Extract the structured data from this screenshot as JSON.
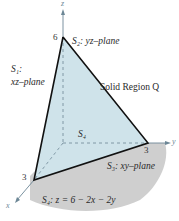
{
  "diagram": {
    "axes": {
      "x_label": "x",
      "y_label": "y",
      "z_label": "z",
      "tick_z": "6",
      "tick_y": "3",
      "tick_x": "3"
    },
    "labels": {
      "s2": "S₂: yz–plane",
      "s1_line1": "S₁:",
      "s1_line2": "xz–plane",
      "solid": "Solid Region Q",
      "s4_center": "S₄",
      "s3": "S₃: xy–plane",
      "s4_eq": "S₄: z = 6 − 2x − 2y"
    },
    "colors": {
      "triangle_fill": "#cfe3ea",
      "ground_fill": "#cfcfcf",
      "edge": "#111111",
      "axis": "#5f7f8f"
    }
  }
}
